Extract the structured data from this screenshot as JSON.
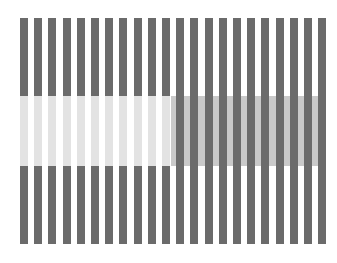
{
  "figure": {
    "type": "whites-illusion",
    "width": 337,
    "height": 263
  },
  "colors": {
    "background": "#ffffff",
    "stripe": "#6b6b6b",
    "left_patch": "#e3e3e3",
    "right_patch": "#c9c9c9"
  },
  "stripes": {
    "count": 22,
    "start_x": 20,
    "period": 14.2,
    "width": 8,
    "top": 18,
    "bottom": 244
  },
  "band": {
    "top": 96,
    "bottom": 166,
    "split_index": 11
  }
}
